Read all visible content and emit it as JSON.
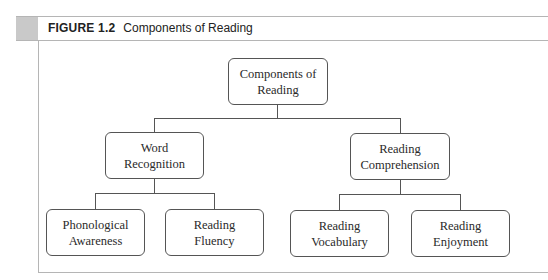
{
  "figure": {
    "label": "FIGURE 1.2",
    "title": "Components of Reading"
  },
  "diagram": {
    "root": {
      "line1": "Components of",
      "line2": "Reading"
    },
    "level2": [
      {
        "line1": "Word",
        "line2": "Recognition"
      },
      {
        "line1": "Reading",
        "line2": "Comprehension"
      }
    ],
    "level3": [
      {
        "line1": "Phonological",
        "line2": "Awareness"
      },
      {
        "line1": "Reading",
        "line2": "Fluency"
      },
      {
        "line1": "Reading",
        "line2": "Vocabulary"
      },
      {
        "line1": "Reading",
        "line2": "Enjoyment"
      }
    ],
    "colors": {
      "header_tab": "#c9c9c9",
      "frame": "#b5b5b5",
      "box_border": "#555555"
    }
  }
}
